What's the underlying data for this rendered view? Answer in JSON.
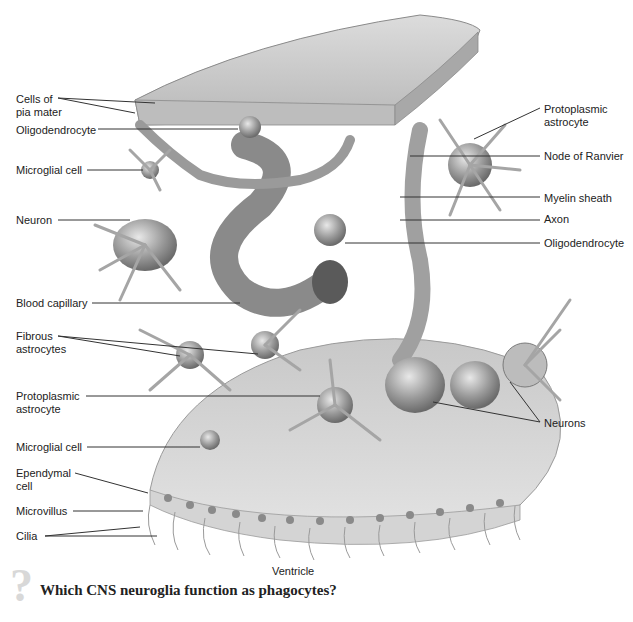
{
  "figure": {
    "labels_left": [
      {
        "id": "cells-of-pia-mater",
        "text": "Cells of\npia mater",
        "x": 16,
        "y": 93
      },
      {
        "id": "oligodendrocyte-left",
        "text": "Oligodendrocyte",
        "x": 16,
        "y": 124
      },
      {
        "id": "microglial-cell-top",
        "text": "Microglial cell",
        "x": 16,
        "y": 164
      },
      {
        "id": "neuron",
        "text": "Neuron",
        "x": 16,
        "y": 214
      },
      {
        "id": "blood-capillary",
        "text": "Blood capillary",
        "x": 16,
        "y": 297
      },
      {
        "id": "fibrous-astrocytes",
        "text": "Fibrous\nastrocytes",
        "x": 16,
        "y": 330
      },
      {
        "id": "protoplasmic-astrocyte-left",
        "text": "Protoplasmic\nastrocyte",
        "x": 16,
        "y": 390
      },
      {
        "id": "microglial-cell-bottom",
        "text": "Microglial cell",
        "x": 16,
        "y": 441
      },
      {
        "id": "ependymal-cell",
        "text": "Ependymal\ncell",
        "x": 16,
        "y": 467
      },
      {
        "id": "microvillus",
        "text": "Microvillus",
        "x": 16,
        "y": 505
      },
      {
        "id": "cilia",
        "text": "Cilia",
        "x": 16,
        "y": 530
      }
    ],
    "labels_right": [
      {
        "id": "protoplasmic-astrocyte-right",
        "text": "Protoplasmic\nastrocyte",
        "x": 544,
        "y": 103
      },
      {
        "id": "node-of-ranvier",
        "text": "Node of Ranvier",
        "x": 544,
        "y": 150
      },
      {
        "id": "myelin-sheath",
        "text": "Myelin sheath",
        "x": 544,
        "y": 192
      },
      {
        "id": "axon",
        "text": "Axon",
        "x": 544,
        "y": 213
      },
      {
        "id": "oligodendrocyte-right",
        "text": "Oligodendrocyte",
        "x": 544,
        "y": 237
      },
      {
        "id": "neurons",
        "text": "Neurons",
        "x": 544,
        "y": 417
      }
    ],
    "caption_ventricle": "Ventricle",
    "question": "Which CNS neuroglia function as phagocytes?",
    "question_icon": "?"
  },
  "colors": {
    "text": "#222222",
    "leader_line": "#333333",
    "tissue_light": "#cfcfcf",
    "tissue_mid": "#a9a9a9",
    "tissue_dark": "#7a7a7a",
    "question_mark": "#d8d8d8"
  }
}
